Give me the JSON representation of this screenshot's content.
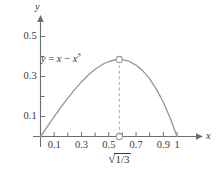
{
  "chart_data": {
    "type": "line",
    "title": "",
    "equation_label": "y = x − x³",
    "equation_parts": {
      "lhs": "y",
      "eq": "=",
      "term1": "x",
      "op": "−",
      "term2_base": "x",
      "term2_exp": "3"
    },
    "xlabel": "x",
    "ylabel": "y",
    "xlim": [
      -0.03,
      1.08
    ],
    "ylim": [
      -0.04,
      0.58
    ],
    "grid": false,
    "legend": "none",
    "x_major_ticks": [
      0.1,
      0.3,
      0.5,
      0.7,
      0.9,
      1.0
    ],
    "x_major_tick_labels": [
      "0.1",
      "0.3",
      "0.5",
      "0.7",
      "0.9",
      "1"
    ],
    "x_minor_ticks": [
      0.0,
      0.2,
      0.4,
      0.6,
      0.8
    ],
    "y_major_ticks": [
      0.1,
      0.3,
      0.5
    ],
    "y_major_tick_labels": [
      "0.1",
      "0.3",
      "0.5"
    ],
    "y_minor_ticks": [
      0.2,
      0.4
    ],
    "x": [
      0.0,
      0.05,
      0.1,
      0.15,
      0.2,
      0.25,
      0.3,
      0.35,
      0.4,
      0.45,
      0.5,
      0.55,
      0.5774,
      0.6,
      0.65,
      0.7,
      0.75,
      0.8,
      0.85,
      0.9,
      0.95,
      1.0
    ],
    "values": [
      0.0,
      0.04988,
      0.099,
      0.14663,
      0.192,
      0.23438,
      0.273,
      0.30713,
      0.336,
      0.35888,
      0.375,
      0.38363,
      0.3849,
      0.384,
      0.37538,
      0.357,
      0.32813,
      0.288,
      0.23588,
      0.171,
      0.09238,
      0.0
    ],
    "annotations": [
      {
        "name": "maximum-point",
        "marker": "open-circle",
        "x": 0.5774,
        "y": 0.3849,
        "label": "√(1/3)",
        "label_numerator": "1",
        "label_denominator": "3",
        "label_radical": "√",
        "dashed_drop_line": true
      },
      {
        "name": "x-axis-root-point",
        "marker": "open-circle",
        "x": 0.5774,
        "y": 0.0
      }
    ],
    "colors": {
      "curve": "#999999",
      "axis": "#6e6e6e",
      "dashed_line": "#a8a8a8",
      "text": "#3a3a3a",
      "marker_stroke": "#999999",
      "marker_fill": "#ffffff"
    }
  }
}
